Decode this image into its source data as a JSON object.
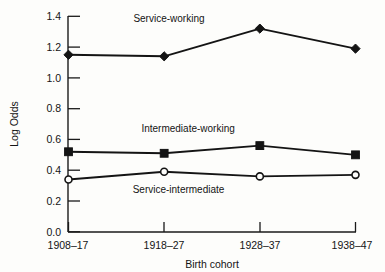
{
  "chart_data": {
    "type": "line",
    "title": "",
    "xlabel": "Birth cohort",
    "ylabel": "Log Odds",
    "categories": [
      "1908–17",
      "1918–27",
      "1928–37",
      "1938–47"
    ],
    "ylim": [
      0.0,
      1.4
    ],
    "yticks": [
      "0.0",
      "0.2",
      "0.4",
      "0.6",
      "0.8",
      "1.0",
      "1.2",
      "1.4"
    ],
    "ytick_values": [
      0.0,
      0.2,
      0.4,
      0.6,
      0.8,
      1.0,
      1.2,
      1.4
    ],
    "grid": false,
    "legend_position": "inline-annotations",
    "series": [
      {
        "name": "Service-working",
        "marker": "filled-diamond",
        "values": [
          1.15,
          1.14,
          1.32,
          1.19
        ],
        "label_x": 1.05,
        "label_y": 1.36
      },
      {
        "name": "Intermediate-working",
        "marker": "filled-square",
        "values": [
          0.52,
          0.51,
          0.56,
          0.5
        ],
        "label_x": 1.25,
        "label_y": 0.65
      },
      {
        "name": "Service-intermediate",
        "marker": "open-circle",
        "values": [
          0.34,
          0.39,
          0.36,
          0.37
        ],
        "label_x": 1.15,
        "label_y": 0.255
      }
    ]
  },
  "axes": {
    "y_title": "Log Odds",
    "x_title": "Birth cohort",
    "y_labels": [
      "1.4",
      "1.2",
      "1.0",
      "0.8",
      "0.6",
      "0.4",
      "0.2",
      "0.0"
    ],
    "x_labels": [
      "1908–17",
      "1918–27",
      "1928–37",
      "1938–47"
    ]
  },
  "series_labels": {
    "service_working": "Service-working",
    "intermediate_working": "Intermediate-working",
    "service_intermediate": "Service-intermediate"
  },
  "colors": {
    "ink": "#141414",
    "background": "#fdfdfb"
  }
}
